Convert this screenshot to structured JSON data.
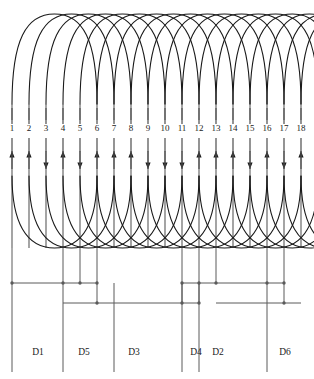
{
  "diagram": {
    "type": "winding-layout",
    "slot_count": 18,
    "slot_numbers": [
      "1",
      "2",
      "3",
      "4",
      "5",
      "6",
      "7",
      "8",
      "9",
      "10",
      "11",
      "12",
      "13",
      "14",
      "15",
      "16",
      "17",
      "18"
    ],
    "phase_labels": [
      "D1",
      "D5",
      "D3",
      "D4",
      "D2",
      "D6"
    ],
    "colors": {
      "line": "#1a1a1a",
      "conductor": "#5a5a5a",
      "background": "#ffffff"
    },
    "geometry": {
      "slot_x": [
        12,
        29,
        46,
        63,
        80,
        97,
        114,
        131,
        148,
        165,
        182,
        199,
        216,
        233,
        250,
        267,
        284,
        301
      ],
      "slot_label_y": 131,
      "arrow_y": 160,
      "top_arc_y": 14,
      "coil_top_y": 104,
      "coil_bottom_y": 148,
      "bottom_arc_y": 248,
      "bus_y": [
        283,
        303
      ],
      "phase_label_y": 355,
      "coil_span": 5
    },
    "arrow_directions": [
      "up",
      "up",
      "down",
      "up",
      "down",
      "up",
      "up",
      "up",
      "down",
      "down",
      "down",
      "up",
      "up",
      "up",
      "down",
      "up",
      "down",
      "up"
    ],
    "phase_label_x": [
      38,
      84,
      134,
      196,
      218,
      285
    ],
    "phase_lead_x": [
      12,
      63,
      114,
      182,
      199,
      267
    ]
  }
}
